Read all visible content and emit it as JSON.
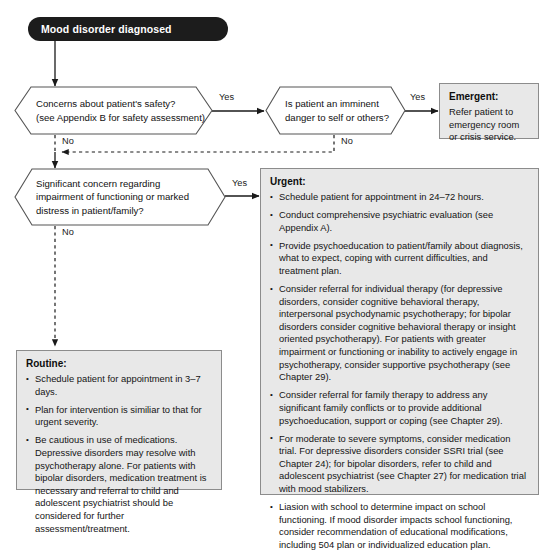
{
  "diagram": {
    "colors": {
      "start_fill": "#1c1c1c",
      "start_text": "#ffffff",
      "box_fill": "#e8e8e8",
      "box_border": "#8c8c8c",
      "line": "#1a1a1a",
      "hex_border": "#555555"
    },
    "start": {
      "label": "Mood disorder diagnosed"
    },
    "decisions": [
      {
        "id": "safety",
        "lines": [
          "Concerns about patient's safety?",
          "(see Appendix B for safety assessment)"
        ],
        "yes_label": "Yes",
        "no_label": "No"
      },
      {
        "id": "imminent-danger",
        "lines": [
          "Is patient an imminent",
          "danger to self or others?"
        ],
        "yes_label": "Yes",
        "no_label": "No"
      },
      {
        "id": "impairment",
        "lines": [
          "Significant concern regarding",
          "impairment of functioning or marked",
          "distress in patient/family?"
        ],
        "yes_label": "Yes",
        "no_label": "No"
      }
    ],
    "outcomes": {
      "emergent": {
        "title": "Emergent:",
        "body": "Refer patient to emergency room or crisis service."
      },
      "urgent": {
        "title": "Urgent:",
        "items": [
          "Schedule patient for appointment in 24–72 hours.",
          "Conduct comprehensive psychiatric evaluation (see Appendix A).",
          "Provide psychoeducation to patient/family about diagnosis, what to expect, coping with current difficulties, and treatment plan.",
          "Consider referral for individual therapy (for depressive disorders, consider cognitive behavioral therapy, interpersonal psychodynamic psychotherapy; for bipolar disorders consider cognitive behavioral therapy or insight oriented psychotherapy). For patients with greater impairment or functioning or inability to actively engage in psychotherapy, consider supportive psychotherapy (see Chapter 29).",
          "Consider referral for family therapy to address any significant family conflicts or to provide additional psychoeducation, support or coping (see Chapter 29).",
          "For moderate to severe symptoms, consider medication trial. For depressive disorders consider SSRI trial (see Chapter 24); for bipolar disorders, refer to child and adolescent psychiatrist (see Chapter 27) for medication trial with mood stabilizers.",
          "Liasion with school to determine impact on school functioning. If mood disorder impacts school functioning, consider recommendation of educational modifications, including 504 plan or individualized education plan."
        ]
      },
      "routine": {
        "title": "Routine:",
        "items": [
          "Schedule patient for appointment in 3–7 days.",
          "Plan for intervention is similiar to that for urgent severity.",
          "Be cautious in use of medications. Depressive disorders may resolve with psychotherapy alone. For patients with bipolar disorders, medication treatment is necessary and referral to child and adolescent psychiatrist should be considered for further assessment/treatment."
        ]
      }
    }
  }
}
